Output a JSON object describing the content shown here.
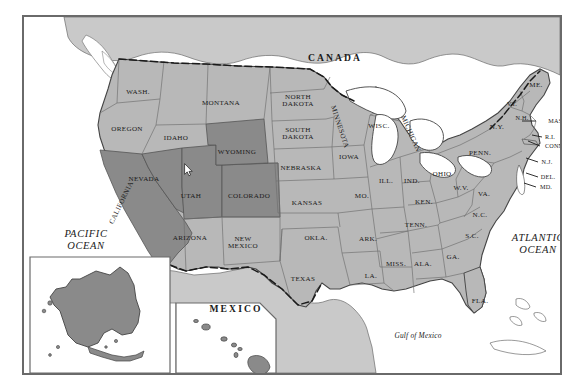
{
  "map": {
    "title": "United States map with highlighted western states",
    "frame": {
      "border_color": "#6a6a6a"
    },
    "colors": {
      "highlight_fill": "#8a8a8a",
      "state_fill": "#b8b8b8",
      "neighbor_fill": "#c9c9c9",
      "water_fill": "#ffffff",
      "border_line": "#555555",
      "state_line": "#6e6e6e",
      "text": "#1a1a1a"
    },
    "countries": [
      {
        "name": "CANADA",
        "x": 311,
        "y": 41
      },
      {
        "name": "MEXICO",
        "x": 212,
        "y": 292
      }
    ],
    "oceans": [
      {
        "name": "PACIFIC\nOCEAN",
        "x": 62,
        "y": 223
      },
      {
        "name": "ATLANTIC\nOCEAN",
        "x": 514,
        "y": 227
      }
    ],
    "seas": [
      {
        "name": "Gulf of Mexico",
        "x": 394,
        "y": 319
      }
    ],
    "insets": [
      {
        "name": "ALASKA",
        "x": 132,
        "y": 367
      },
      {
        "name": "HAWAII",
        "x": 209,
        "y": 367
      }
    ],
    "highlighted_states": [
      "CALIFORNIA",
      "NEVADA",
      "UTAH",
      "COLORADO",
      "WYOMING",
      "ALASKA",
      "HAWAII"
    ],
    "states": [
      {
        "name": "WASH.",
        "x": 114,
        "y": 76,
        "cls": "state"
      },
      {
        "name": "OREGON",
        "x": 103,
        "y": 113,
        "cls": "state"
      },
      {
        "name": "IDAHO",
        "x": 152,
        "y": 122,
        "cls": "state"
      },
      {
        "name": "MONTANA",
        "x": 197,
        "y": 87,
        "cls": "state"
      },
      {
        "name": "WYOMING",
        "x": 213,
        "y": 136,
        "cls": "state"
      },
      {
        "name": "NEVADA",
        "x": 120,
        "y": 163,
        "cls": "state"
      },
      {
        "name": "UTAH",
        "x": 167,
        "y": 180,
        "cls": "state"
      },
      {
        "name": "COLORADO",
        "x": 225,
        "y": 180,
        "cls": "state"
      },
      {
        "name": "CALIFORNIA",
        "x": 98,
        "y": 186,
        "cls": "state",
        "rot": -64
      },
      {
        "name": "ARIZONA",
        "x": 166,
        "y": 222,
        "cls": "state"
      },
      {
        "name": "NEW\nMEXICO",
        "x": 219,
        "y": 226,
        "cls": "state2"
      },
      {
        "name": "NORTH\nDAKOTA",
        "x": 274,
        "y": 84,
        "cls": "state2"
      },
      {
        "name": "SOUTH\nDAKOTA",
        "x": 274,
        "y": 117,
        "cls": "state2"
      },
      {
        "name": "NEBRASKA",
        "x": 277,
        "y": 152,
        "cls": "state"
      },
      {
        "name": "KANSAS",
        "x": 283,
        "y": 187,
        "cls": "state"
      },
      {
        "name": "OKLA.",
        "x": 292,
        "y": 222,
        "cls": "state"
      },
      {
        "name": "TEXAS",
        "x": 279,
        "y": 263,
        "cls": "state"
      },
      {
        "name": "MINNESOTA",
        "x": 315,
        "y": 110,
        "cls": "state",
        "rot": 72
      },
      {
        "name": "IOWA",
        "x": 325,
        "y": 141,
        "cls": "state"
      },
      {
        "name": "MO.",
        "x": 338,
        "y": 180,
        "cls": "state"
      },
      {
        "name": "ARK.",
        "x": 344,
        "y": 223,
        "cls": "state"
      },
      {
        "name": "LA.",
        "x": 347,
        "y": 260,
        "cls": "state"
      },
      {
        "name": "WISC.",
        "x": 355,
        "y": 110,
        "cls": "state"
      },
      {
        "name": "ILL.",
        "x": 362,
        "y": 165,
        "cls": "state"
      },
      {
        "name": "MISS.",
        "x": 372,
        "y": 248,
        "cls": "state"
      },
      {
        "name": "MICHIGAN",
        "x": 386,
        "y": 117,
        "cls": "state",
        "rot": 66
      },
      {
        "name": "IND.",
        "x": 388,
        "y": 165,
        "cls": "state"
      },
      {
        "name": "KEN.",
        "x": 400,
        "y": 186,
        "cls": "state"
      },
      {
        "name": "TENN.",
        "x": 392,
        "y": 209,
        "cls": "state"
      },
      {
        "name": "ALA.",
        "x": 399,
        "y": 248,
        "cls": "state"
      },
      {
        "name": "OHIO",
        "x": 418,
        "y": 158,
        "cls": "state"
      },
      {
        "name": "W.V.",
        "x": 437,
        "y": 172,
        "cls": "state"
      },
      {
        "name": "GA.",
        "x": 429,
        "y": 241,
        "cls": "state"
      },
      {
        "name": "PENN.",
        "x": 456,
        "y": 137,
        "cls": "state"
      },
      {
        "name": "VA.",
        "x": 460,
        "y": 178,
        "cls": "state"
      },
      {
        "name": "N.C.",
        "x": 456,
        "y": 199,
        "cls": "state"
      },
      {
        "name": "S.C.",
        "x": 448,
        "y": 220,
        "cls": "state"
      },
      {
        "name": "FLA.",
        "x": 456,
        "y": 285,
        "cls": "state"
      },
      {
        "name": "N.Y.",
        "x": 473,
        "y": 111,
        "cls": "state"
      },
      {
        "name": "VT.",
        "x": 488,
        "y": 87,
        "cls": "small"
      },
      {
        "name": "N.H.",
        "x": 498,
        "y": 101,
        "cls": "small"
      },
      {
        "name": "ME.",
        "x": 512,
        "y": 69,
        "cls": "state"
      },
      {
        "name": "MASS.",
        "x": 534,
        "y": 104,
        "cls": "small"
      },
      {
        "name": "R.I.",
        "x": 526,
        "y": 120,
        "cls": "small"
      },
      {
        "name": "CONN.",
        "x": 531,
        "y": 129,
        "cls": "small"
      },
      {
        "name": "N.J.",
        "x": 523,
        "y": 145,
        "cls": "small"
      },
      {
        "name": "DEL.",
        "x": 524,
        "y": 160,
        "cls": "small"
      },
      {
        "name": "MD.",
        "x": 522,
        "y": 170,
        "cls": "small"
      }
    ],
    "cursor": {
      "x": 160,
      "y": 146
    }
  }
}
